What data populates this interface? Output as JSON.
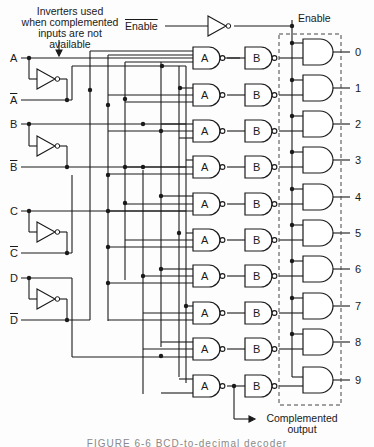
{
  "annotation": {
    "inverters_note": [
      "Inverters used",
      "when complemented",
      "inputs are not available"
    ]
  },
  "inputs": [
    {
      "label": "A",
      "complement": false
    },
    {
      "label": "A",
      "complement": true
    },
    {
      "label": "B",
      "complement": false
    },
    {
      "label": "B",
      "complement": true
    },
    {
      "label": "C",
      "complement": false
    },
    {
      "label": "C",
      "complement": true
    },
    {
      "label": "D",
      "complement": false
    },
    {
      "label": "D",
      "complement": true
    }
  ],
  "enable": {
    "input_label": "Enable",
    "input_complemented": true,
    "bus_label": "Enable"
  },
  "gates": {
    "first_stage_label": "A",
    "second_stage_label": "B"
  },
  "outputs": [
    "0",
    "1",
    "2",
    "3",
    "4",
    "5",
    "6",
    "7",
    "8",
    "9"
  ],
  "complemented_output": [
    "Complemented",
    "output"
  ],
  "caption": "FIGURE 6-6   BCD-to-decimal decoder"
}
